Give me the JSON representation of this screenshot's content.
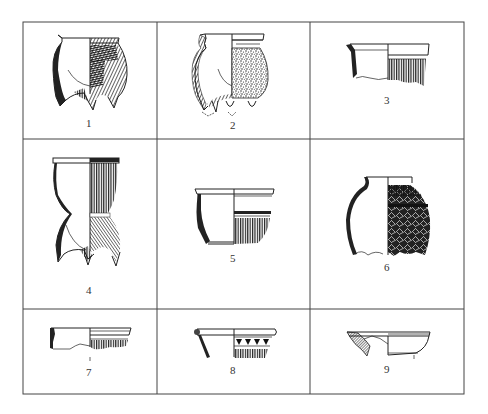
{
  "figure": {
    "type": "archaeological pottery typology plate",
    "layout": {
      "rows": 3,
      "columns": 3
    },
    "grid_color": "#444444",
    "ink_color": "#222222",
    "background": "#ffffff"
  },
  "vessels": [
    {
      "number": "1",
      "form": "tripod li (hollow-legged cooking vessel)",
      "decoration": "cord-marked body, crossed hatching"
    },
    {
      "number": "2",
      "form": "tripod li with flared neck",
      "decoration": "stippled/granular surface"
    },
    {
      "number": "3",
      "form": "jar rim fragment",
      "decoration": "vertical cord marks below rim"
    },
    {
      "number": "4",
      "form": "tall tripod li (waisted)",
      "decoration": "vertical cord marks, plain band at waist"
    },
    {
      "number": "5",
      "form": "basin/bowl",
      "decoration": "horizontal bands over vertical cord marks"
    },
    {
      "number": "6",
      "form": "jar (upper body)",
      "decoration": "crossed/woven cord marks"
    },
    {
      "number": "7",
      "form": "basin rim fragment",
      "decoration": "vertical cord marks"
    },
    {
      "number": "8",
      "form": "bowl rim fragment",
      "decoration": "triangle band over cord marks"
    },
    {
      "number": "9",
      "form": "shallow basin/dish",
      "decoration": "plain, thick hatched wall section"
    }
  ]
}
